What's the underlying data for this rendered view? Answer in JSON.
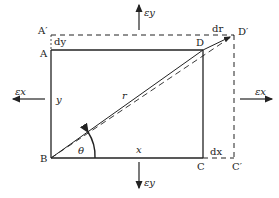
{
  "diagram": {
    "points": {
      "A": "A",
      "A_prime": "A′",
      "B": "B",
      "C": "C",
      "C_prime": "C′",
      "D": "D",
      "D_prime": "D′"
    },
    "dims": {
      "x": "x",
      "y": "y",
      "r": "r",
      "theta": "θ",
      "dx": "dx",
      "dy": "dy",
      "dr": "dr"
    },
    "strains": {
      "ex_left": "εx",
      "ex_right": "εx",
      "ey_top": "εy",
      "ey_bottom": "εy"
    },
    "colors": {
      "line": "#222222",
      "background": "#ffffff"
    }
  }
}
